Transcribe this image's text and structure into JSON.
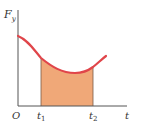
{
  "diagram": {
    "type": "force-time graph (impulse area)",
    "y_axis_label": "F",
    "y_axis_subscript": "y",
    "x_axis_label": "t",
    "origin_label": "O",
    "markers": [
      {
        "label": "t",
        "subscript": "1"
      },
      {
        "label": "t",
        "subscript": "2"
      }
    ],
    "colors": {
      "curve": "#e0454a",
      "area": "#f0a878",
      "axes": "#555555",
      "bounds": "#7a5a48"
    }
  }
}
